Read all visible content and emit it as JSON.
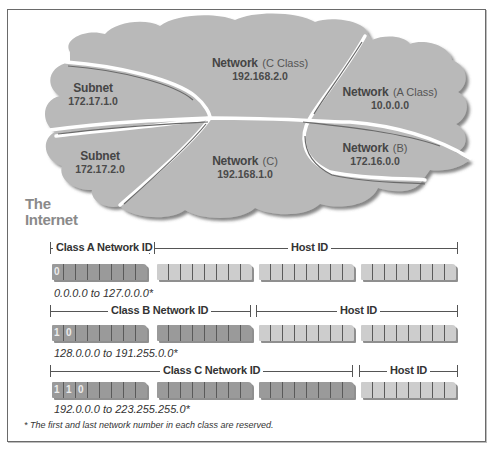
{
  "cloud_diagram": {
    "regions": [
      {
        "name": "Subnet",
        "qualifier": "",
        "address": "172.17.1.0"
      },
      {
        "name": "Network",
        "qualifier": "(C Class)",
        "address": "192.168.2.0"
      },
      {
        "name": "Network",
        "qualifier": "(A Class)",
        "address": "10.0.0.0"
      },
      {
        "name": "Subnet",
        "qualifier": "",
        "address": "172.17.2.0"
      },
      {
        "name": "Network",
        "qualifier": "(C)",
        "address": "192.168.1.0"
      },
      {
        "name": "Network",
        "qualifier": "(B)",
        "address": "172.16.0.0"
      }
    ],
    "internet_label_line1": "The",
    "internet_label_line2": "Internet"
  },
  "address_classes": [
    {
      "class": "A",
      "network_label": "Class A Network ID",
      "host_label": "Host ID",
      "leading_bits": [
        "0"
      ],
      "network_bytes": 1,
      "range": "0.0.0.0 to 127.0.0.0*"
    },
    {
      "class": "B",
      "network_label": "Class B Network ID",
      "host_label": "Host ID",
      "leading_bits": [
        "1",
        "0"
      ],
      "network_bytes": 2,
      "range": "128.0.0.0 to 191.255.0.0*"
    },
    {
      "class": "C",
      "network_label": "Class C Network ID",
      "host_label": "Host ID",
      "leading_bits": [
        "1",
        "1",
        "0"
      ],
      "network_bytes": 3,
      "range": "192.0.0.0 to 223.255.255.0*"
    }
  ],
  "footnote": "* The first and last network number in each class are reserved.",
  "colors": {
    "cloud_fill": "#b9b9b9",
    "network_byte": "#9a9a9a",
    "host_byte": "#cdcdcd",
    "divider": "#ffffff"
  }
}
